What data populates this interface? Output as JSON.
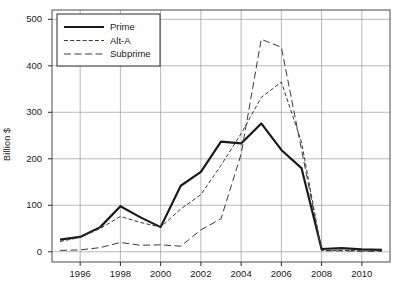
{
  "chart_data": {
    "type": "line",
    "title": "",
    "xlabel": "",
    "ylabel": "Billion $",
    "xlim": [
      1994.6,
      2011.4
    ],
    "ylim": [
      -22,
      520
    ],
    "grid": true,
    "legend_position": "top-left",
    "xticks": [
      1996,
      1998,
      2000,
      2002,
      2004,
      2006,
      2008,
      2010
    ],
    "yticks": [
      0,
      100,
      200,
      300,
      400,
      500
    ],
    "x": [
      1995,
      1996,
      1997,
      1998,
      1999,
      2000,
      2001,
      2002,
      2003,
      2004,
      2005,
      2006,
      2007,
      2008,
      2009,
      2010,
      2011
    ],
    "series": [
      {
        "name": "Prime",
        "style": "solid",
        "color": "#1a1a1a",
        "width": 2.2,
        "values": [
          26,
          32,
          53,
          98,
          74,
          53,
          142,
          172,
          237,
          233,
          276,
          219,
          180,
          6,
          8,
          5,
          4
        ]
      },
      {
        "name": "Alt-A",
        "style": "fine-dashed",
        "color": "#3a3a3a",
        "width": 1.0,
        "values": [
          22,
          31,
          50,
          76,
          63,
          53,
          92,
          123,
          186,
          254,
          332,
          365,
          236,
          3,
          3,
          2,
          2
        ]
      },
      {
        "name": "Subprime",
        "style": "long-dashed",
        "color": "#3a3a3a",
        "width": 1.0,
        "values": [
          3,
          4,
          9,
          20,
          14,
          15,
          12,
          47,
          71,
          210,
          457,
          440,
          220,
          2,
          2,
          1,
          1
        ]
      }
    ]
  },
  "legend": {
    "items": [
      {
        "label": "Prime"
      },
      {
        "label": "Alt-A"
      },
      {
        "label": "Subprime"
      }
    ]
  },
  "axes": {
    "y_label": "Billion $",
    "y_ticks": [
      "0",
      "100",
      "200",
      "300",
      "400",
      "500"
    ],
    "x_ticks": [
      "1996",
      "1998",
      "2000",
      "2002",
      "2004",
      "2006",
      "2008",
      "2010"
    ]
  }
}
